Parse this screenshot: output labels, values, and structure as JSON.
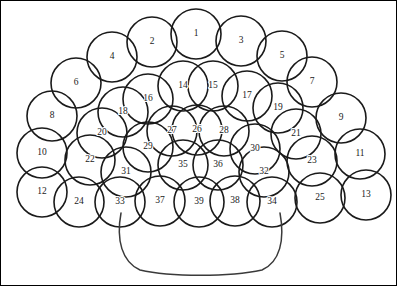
{
  "figure": {
    "background_color": "#ffffff",
    "stroke_color": "#1a1a1a",
    "basket_stroke_color": "#3a3a3a",
    "frame_color": "#000000",
    "width": 397,
    "height": 286
  },
  "chart_data": {
    "type": "diagram",
    "circle_radius": 24,
    "circles": [
      {
        "label": "1",
        "cx": 196,
        "cy": 34,
        "r": 25
      },
      {
        "label": "2",
        "cx": 152,
        "cy": 42,
        "r": 25
      },
      {
        "label": "3",
        "cx": 241,
        "cy": 41,
        "r": 25
      },
      {
        "label": "4",
        "cx": 112,
        "cy": 57,
        "r": 25
      },
      {
        "label": "5",
        "cx": 282,
        "cy": 56,
        "r": 25
      },
      {
        "label": "6",
        "cx": 76,
        "cy": 83,
        "r": 25
      },
      {
        "label": "7",
        "cx": 312,
        "cy": 82,
        "r": 25
      },
      {
        "label": "8",
        "cx": 52,
        "cy": 116,
        "r": 25
      },
      {
        "label": "9",
        "cx": 341,
        "cy": 118,
        "r": 25
      },
      {
        "label": "10",
        "cx": 42,
        "cy": 153,
        "r": 25
      },
      {
        "label": "11",
        "cx": 360,
        "cy": 154,
        "r": 25
      },
      {
        "label": "12",
        "cx": 42,
        "cy": 192,
        "r": 25
      },
      {
        "label": "13",
        "cx": 366,
        "cy": 195,
        "r": 25
      },
      {
        "label": "14",
        "cx": 183,
        "cy": 86,
        "r": 25
      },
      {
        "label": "15",
        "cx": 213,
        "cy": 86,
        "r": 25
      },
      {
        "label": "16",
        "cx": 148,
        "cy": 99,
        "r": 25
      },
      {
        "label": "17",
        "cx": 247,
        "cy": 96,
        "r": 25
      },
      {
        "label": "18",
        "cx": 123,
        "cy": 112,
        "r": 25
      },
      {
        "label": "19",
        "cx": 278,
        "cy": 108,
        "r": 25
      },
      {
        "label": "20",
        "cx": 102,
        "cy": 133,
        "r": 25
      },
      {
        "label": "21",
        "cx": 296,
        "cy": 134,
        "r": 25
      },
      {
        "label": "22",
        "cx": 90,
        "cy": 160,
        "r": 25
      },
      {
        "label": "23",
        "cx": 312,
        "cy": 161,
        "r": 25
      },
      {
        "label": "24",
        "cx": 79,
        "cy": 202,
        "r": 25
      },
      {
        "label": "25",
        "cx": 320,
        "cy": 198,
        "r": 25
      },
      {
        "label": "26",
        "cx": 197,
        "cy": 130,
        "r": 25
      },
      {
        "label": "27",
        "cx": 172,
        "cy": 131,
        "r": 25
      },
      {
        "label": "28",
        "cx": 224,
        "cy": 131,
        "r": 25
      },
      {
        "label": "29",
        "cx": 148,
        "cy": 147,
        "r": 25
      },
      {
        "label": "30",
        "cx": 255,
        "cy": 149,
        "r": 25
      },
      {
        "label": "31",
        "cx": 126,
        "cy": 172,
        "r": 25
      },
      {
        "label": "32",
        "cx": 264,
        "cy": 172,
        "r": 25
      },
      {
        "label": "33",
        "cx": 120,
        "cy": 202,
        "r": 25
      },
      {
        "label": "34",
        "cx": 272,
        "cy": 202,
        "r": 25
      },
      {
        "label": "35",
        "cx": 183,
        "cy": 165,
        "r": 25
      },
      {
        "label": "36",
        "cx": 218,
        "cy": 165,
        "r": 25
      },
      {
        "label": "37",
        "cx": 160,
        "cy": 201,
        "r": 25
      },
      {
        "label": "38",
        "cx": 235,
        "cy": 201,
        "r": 25
      },
      {
        "label": "39",
        "cx": 199,
        "cy": 202,
        "r": 25
      }
    ],
    "basket": {
      "name": "basket-outline",
      "path": "M 121 213 C 116 240 122 262 140 270 C 170 277 230 277 262 270 C 280 262 285 240 280 213",
      "rim_note": "open at top, rounded trapezoid body"
    },
    "frame": {
      "name": "page-border",
      "x": 0.5,
      "y": 0.5,
      "width": 396,
      "height": 285
    }
  }
}
